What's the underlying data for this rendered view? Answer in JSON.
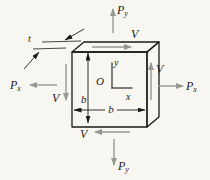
{
  "figure": {
    "labels": {
      "P": "P",
      "sub_x": "x",
      "sub_y": "y",
      "V": "V",
      "b": "b",
      "t": "t",
      "O": "O",
      "axis_x": "x",
      "axis_y": "y"
    },
    "colors": {
      "background": "#f8f6f0",
      "front_face": "#c8c7c3",
      "top_face": "#eceae5",
      "side_face_top": "#8d8c89",
      "side_face_bottom": "#b6b5b1",
      "outline": "#1b1b1b",
      "force_arrow": "#999792"
    }
  }
}
